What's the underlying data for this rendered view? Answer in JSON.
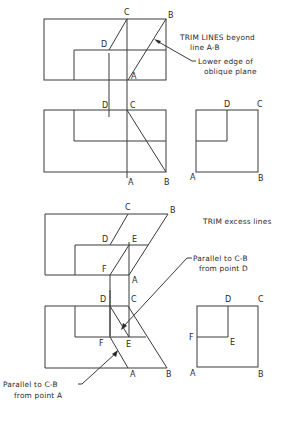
{
  "figures": {
    "step1": {
      "points": {
        "C": "C",
        "B": "B",
        "D": "D",
        "A": "A"
      },
      "annotation_trim": [
        "TRIM LINES beyond",
        "line A-B"
      ],
      "annotation_edge": [
        "Lower edge of",
        "oblique plane"
      ]
    },
    "step1_front": {
      "points": {
        "D": "D",
        "C": "C",
        "A": "A",
        "B": "B"
      }
    },
    "step1_side": {
      "points": {
        "D": "D",
        "C": "C",
        "A": "A",
        "B": "B"
      }
    },
    "step2": {
      "points": {
        "C": "C",
        "B": "B",
        "D": "D",
        "E": "E",
        "F": "F",
        "A": "A"
      },
      "annotation_trim": "TRIM excess lines",
      "annotation_parallel_d": [
        "Parallel to C-B",
        "from point D"
      ]
    },
    "step2_front": {
      "points": {
        "D": "D",
        "C": "C",
        "F": "F",
        "E": "E",
        "A": "A",
        "B": "B"
      },
      "annotation_parallel_a": [
        "Parallel to C-B",
        "from point A"
      ]
    },
    "step2_side": {
      "points": {
        "D": "D",
        "C": "C",
        "F": "F",
        "E": "E",
        "A": "A",
        "B": "B"
      }
    }
  },
  "colors": {
    "line": "#3a3a3a",
    "text": "#2a2a2a",
    "background": "#ffffff"
  }
}
